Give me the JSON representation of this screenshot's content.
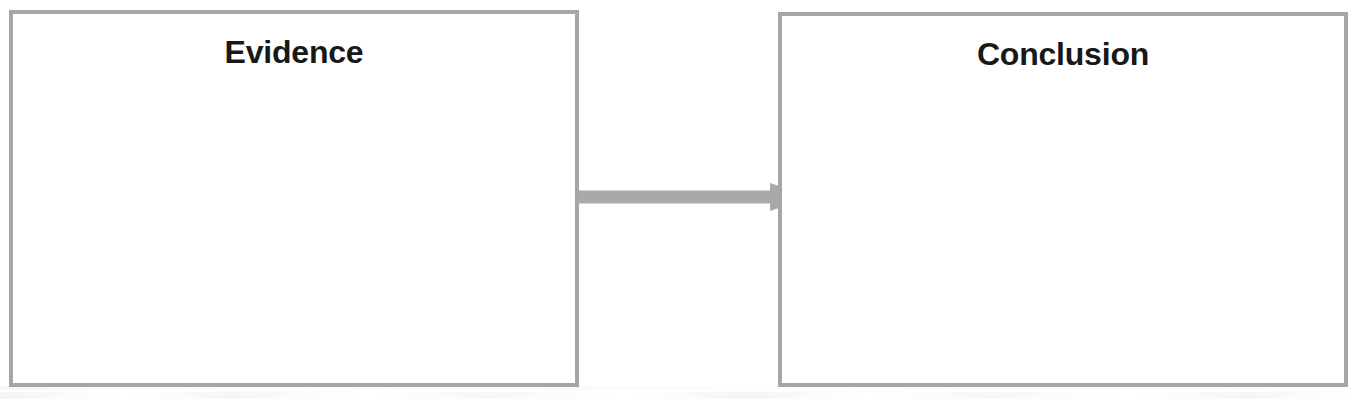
{
  "diagram": {
    "type": "flow",
    "orientation": "left-to-right",
    "background_color": "#ffffff",
    "nodes": [
      {
        "id": "evidence",
        "label": "Evidence",
        "shape": "rectangle",
        "fill_color": "#ffffff",
        "border_color": "#a6a6a6",
        "text_color": "#181818",
        "empty_body": true
      },
      {
        "id": "conclusion",
        "label": "Conclusion",
        "shape": "rectangle",
        "fill_color": "#ffffff",
        "border_color": "#a6a6a6",
        "text_color": "#181818",
        "empty_body": true
      }
    ],
    "edges": [
      {
        "id": "evidence-to-conclusion",
        "from": "evidence",
        "to": "conclusion",
        "label": "",
        "style": "solid",
        "arrowhead": "triangle",
        "color": "#a6a6a6"
      }
    ]
  }
}
